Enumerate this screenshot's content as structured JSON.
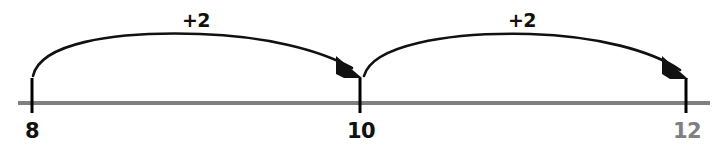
{
  "figure": {
    "type": "number-line-jumps",
    "background_color": "#ffffff"
  },
  "number_line": {
    "axis_color": "#808080",
    "axis_thickness": 4,
    "axis_y": 103,
    "axis_x_start": 18,
    "axis_x_end": 710,
    "tick_color": "#000000",
    "tick_thickness": 3,
    "tick_top": 78,
    "tick_bottom": 113,
    "ticks": [
      {
        "value": "8",
        "label": "8",
        "x": 32,
        "label_color": "#111111",
        "label_x": 32,
        "label_y": 138
      },
      {
        "value": "10",
        "label": "10",
        "x": 360,
        "label_color": "#111111",
        "label_x": 361,
        "label_y": 138
      },
      {
        "value": "12",
        "label": "12",
        "x": 686,
        "label_color": "#808080",
        "label_x": 687,
        "label_y": 138
      }
    ]
  },
  "jumps": [
    {
      "label": "+2",
      "from": "8",
      "to": "10",
      "color": "#111111",
      "label_color": "#111111",
      "label_x": 196,
      "label_y": 27,
      "start_x": 33,
      "start_y": 76,
      "end_x": 358,
      "end_y": 74,
      "apex_y": 38
    },
    {
      "label": "+2",
      "from": "10",
      "to": "12",
      "color": "#111111",
      "label_color": "#111111",
      "label_x": 522,
      "label_y": 27,
      "start_x": 364,
      "start_y": 76,
      "end_x": 684,
      "end_y": 76,
      "apex_y": 38
    }
  ],
  "chart_data": {
    "type": "line",
    "xlabel": "",
    "ylabel": "",
    "xlim": [
      8,
      12
    ],
    "categories": [
      "8",
      "10",
      "12"
    ],
    "values": [
      8,
      10,
      12
    ],
    "annotations": [
      "+2",
      "+2"
    ],
    "grid": false,
    "legend": "none"
  }
}
